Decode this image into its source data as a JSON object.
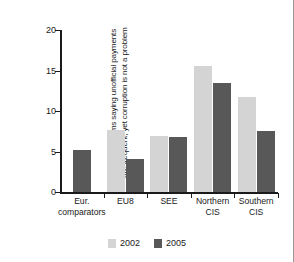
{
  "chart_data": {
    "type": "bar",
    "title": "",
    "subtitle": "",
    "xlabel": "",
    "ylabel": "Percent of firms saying unofficial payments are frequent, yet corruption is not a problem",
    "ylabel_lines": [
      "Percent of firms saying unofficial payments",
      "are frequent, yet corruption is not a problem"
    ],
    "categories": [
      "Eur. comparators",
      "EU8",
      "SEE",
      "Northern CIS",
      "Southern CIS"
    ],
    "category_lines": [
      [
        "Eur.",
        "comparators"
      ],
      [
        "EU8",
        ""
      ],
      [
        "SEE",
        ""
      ],
      [
        "Northern",
        "CIS"
      ],
      [
        "Southern",
        "CIS"
      ]
    ],
    "series": [
      {
        "name": "2002",
        "color": "#d4d4d4",
        "values": [
          null,
          7.6,
          6.9,
          15.6,
          11.7
        ]
      },
      {
        "name": "2005",
        "color": "#585858",
        "values": [
          5.2,
          4.1,
          6.8,
          13.5,
          7.5
        ]
      }
    ],
    "ylim": [
      0,
      20
    ],
    "yticks": [
      0,
      5,
      10,
      15,
      20
    ],
    "ytick_labels": [
      "0",
      "5",
      "10",
      "15",
      "20"
    ],
    "grid": false,
    "legend_position": "bottom"
  },
  "legend": {
    "items": [
      {
        "label": "2002",
        "color": "#d4d4d4"
      },
      {
        "label": "2005",
        "color": "#585858"
      }
    ]
  },
  "colors": {
    "series_2002": "#d4d4d4",
    "series_2005": "#585858",
    "axis": "#1a1a1a",
    "background": "#ffffff",
    "frame_border": "#9a9a9a"
  }
}
